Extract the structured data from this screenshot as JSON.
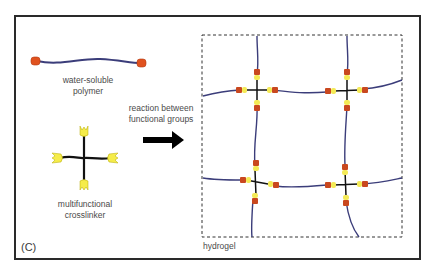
{
  "panel": {
    "label": "(C)"
  },
  "polymer": {
    "line1": "water-soluble",
    "line2": "polymer"
  },
  "crosslinker": {
    "line1": "multifunctional",
    "line2": "crosslinker"
  },
  "reaction": {
    "line1": "reaction between",
    "line2": "functional groups"
  },
  "hydrogel": {
    "label": "hydrogel"
  },
  "colors": {
    "frame": "#2a2a2a",
    "polymer_chain": "#3b3d7a",
    "end_group": "#e0521f",
    "crosslinker_arm": "#111111",
    "crosslinker_group": "#f5ec4a",
    "linked_red": "#c9481f",
    "linked_yellow": "#f4ea56",
    "text": "#4a4a4a"
  }
}
